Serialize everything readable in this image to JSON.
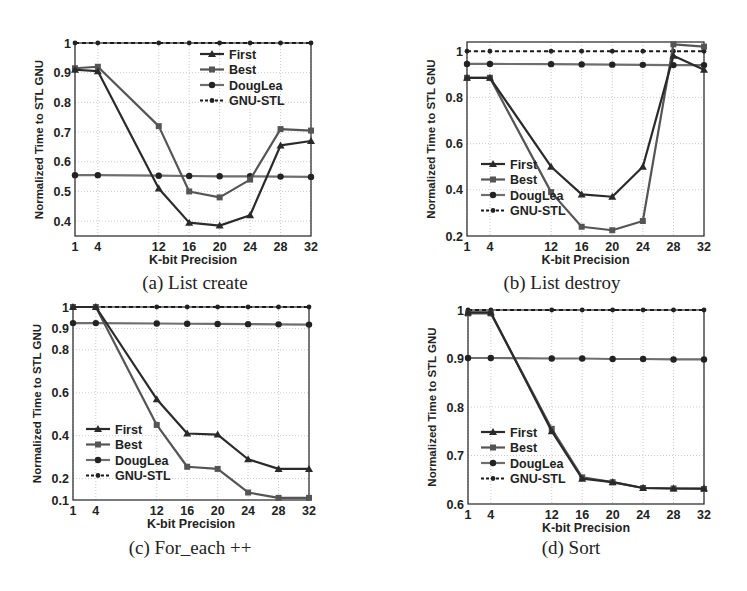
{
  "figure": {
    "colors": {
      "first": "#2a2a2a",
      "best": "#555555",
      "douglea": "#6e6e6e",
      "gnu": "#1a1a1a",
      "grid": "#bdbdbd",
      "axis": "#222222"
    }
  },
  "chart_data": [
    {
      "id": "a",
      "type": "line",
      "title": "(a) List create",
      "xlabel": "K-bit Precision",
      "ylabel": "Normalized Time to STL GNU",
      "x": [
        1,
        4,
        12,
        16,
        20,
        24,
        28,
        32
      ],
      "xticks": [
        1,
        4,
        12,
        16,
        20,
        24,
        28,
        32
      ],
      "yticks": [
        0.4,
        0.5,
        0.6,
        0.7,
        0.8,
        0.9,
        1
      ],
      "ylim": [
        0.35,
        1.0
      ],
      "grid": true,
      "legend_position": "upper right",
      "series": [
        {
          "name": "First",
          "marker": "triangle",
          "values": [
            0.91,
            0.905,
            0.51,
            0.395,
            0.385,
            0.42,
            0.655,
            0.67
          ]
        },
        {
          "name": "Best",
          "marker": "square",
          "values": [
            0.915,
            0.92,
            0.72,
            0.5,
            0.48,
            0.54,
            0.71,
            0.705
          ]
        },
        {
          "name": "DougLea",
          "marker": "circle",
          "values": [
            0.555,
            0.555,
            0.553,
            0.552,
            0.551,
            0.551,
            0.55,
            0.549
          ]
        },
        {
          "name": "GNU-STL",
          "marker": "dot",
          "dashed": true,
          "values": [
            1,
            1,
            1,
            1,
            1,
            1,
            1,
            1
          ]
        }
      ]
    },
    {
      "id": "b",
      "type": "line",
      "title": "(b) List destroy",
      "xlabel": "K-bit Precision",
      "ylabel": "Normalized Time to STL GNU",
      "x": [
        1,
        4,
        12,
        16,
        20,
        24,
        28,
        32
      ],
      "xticks": [
        1,
        4,
        12,
        16,
        20,
        24,
        28,
        32
      ],
      "yticks": [
        0.2,
        0.4,
        0.6,
        0.8,
        1
      ],
      "ylim": [
        0.2,
        1.04
      ],
      "grid": true,
      "legend_position": "lower left",
      "series": [
        {
          "name": "First",
          "marker": "triangle",
          "values": [
            0.885,
            0.885,
            0.5,
            0.38,
            0.37,
            0.5,
            0.98,
            0.92
          ]
        },
        {
          "name": "Best",
          "marker": "square",
          "values": [
            0.885,
            0.885,
            0.39,
            0.24,
            0.225,
            0.265,
            1.03,
            1.02
          ]
        },
        {
          "name": "DougLea",
          "marker": "circle",
          "values": [
            0.945,
            0.945,
            0.944,
            0.943,
            0.942,
            0.941,
            0.94,
            0.94
          ]
        },
        {
          "name": "GNU-STL",
          "marker": "dot",
          "dashed": true,
          "values": [
            1,
            1,
            1,
            1,
            1,
            1,
            1,
            1
          ]
        }
      ]
    },
    {
      "id": "c",
      "type": "line",
      "title": "(c) For_each ++",
      "xlabel": "K-bit Precision",
      "ylabel": "Normalized Time to STL GNU",
      "x": [
        1,
        4,
        12,
        16,
        20,
        24,
        28,
        32
      ],
      "xticks": [
        1,
        4,
        12,
        16,
        20,
        24,
        28,
        32
      ],
      "yticks": [
        0.1,
        0.2,
        0.4,
        0.6,
        0.8,
        0.9,
        1
      ],
      "ylim": [
        0.1,
        1.0
      ],
      "grid": true,
      "legend_position": "lower left",
      "series": [
        {
          "name": "First",
          "marker": "triangle",
          "values": [
            1.0,
            1.0,
            0.57,
            0.41,
            0.405,
            0.29,
            0.245,
            0.245
          ]
        },
        {
          "name": "Best",
          "marker": "square",
          "values": [
            1.0,
            1.0,
            0.45,
            0.255,
            0.245,
            0.135,
            0.11,
            0.11
          ]
        },
        {
          "name": "DougLea",
          "marker": "circle",
          "values": [
            0.925,
            0.925,
            0.923,
            0.922,
            0.921,
            0.92,
            0.919,
            0.918
          ]
        },
        {
          "name": "GNU-STL",
          "marker": "dot",
          "dashed": true,
          "values": [
            1,
            1,
            1,
            1,
            1,
            1,
            1,
            1
          ]
        }
      ]
    },
    {
      "id": "d",
      "type": "line",
      "title": "(d) Sort",
      "xlabel": "K-bit Precision",
      "ylabel": "Normalized Time to STL GNU",
      "x": [
        1,
        4,
        12,
        16,
        20,
        24,
        28,
        32
      ],
      "xticks": [
        1,
        4,
        12,
        16,
        20,
        24,
        28,
        32
      ],
      "yticks": [
        0.6,
        0.7,
        0.8,
        0.9,
        1
      ],
      "ylim": [
        0.6,
        1.0
      ],
      "grid": true,
      "legend_position": "lower left",
      "series": [
        {
          "name": "First",
          "marker": "triangle",
          "values": [
            0.995,
            0.995,
            0.75,
            0.652,
            0.645,
            0.633,
            0.632,
            0.632
          ]
        },
        {
          "name": "Best",
          "marker": "square",
          "values": [
            0.993,
            0.993,
            0.755,
            0.655,
            0.645,
            0.633,
            0.632,
            0.631
          ]
        },
        {
          "name": "DougLea",
          "marker": "circle",
          "values": [
            0.901,
            0.901,
            0.9,
            0.9,
            0.899,
            0.899,
            0.898,
            0.898
          ]
        },
        {
          "name": "GNU-STL",
          "marker": "dot",
          "dashed": true,
          "values": [
            1,
            1,
            1,
            1,
            1,
            1,
            1,
            1
          ]
        }
      ]
    }
  ],
  "panels": {
    "a": {
      "caption": "(a) List create"
    },
    "b": {
      "caption": "(b) List destroy"
    },
    "c": {
      "caption": "(c) For_each ++"
    },
    "d": {
      "caption": "(d) Sort"
    }
  }
}
